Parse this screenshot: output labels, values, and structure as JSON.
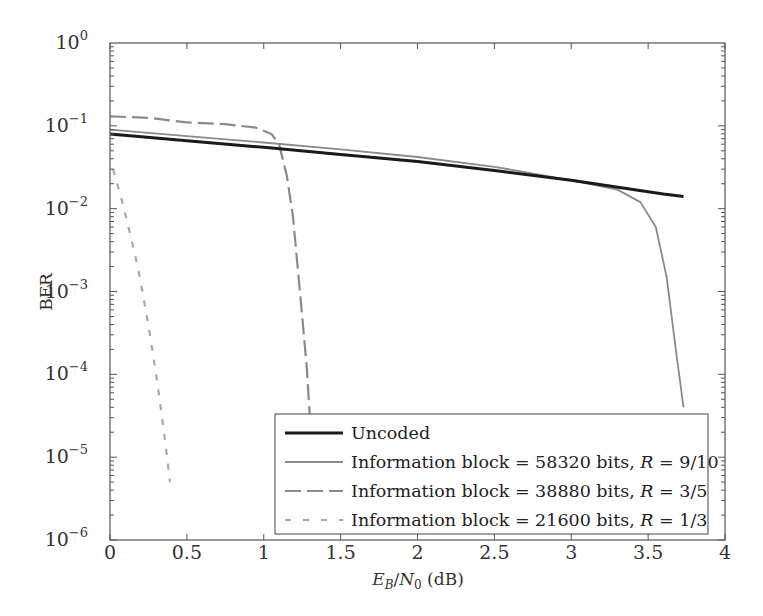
{
  "chart_data": {
    "type": "line",
    "title": "",
    "xlabel": "E_B/N_0 (dB)",
    "xlabel_parts": {
      "E": "E",
      "Esub": "B",
      "slash": "/",
      "N": "N",
      "Nsub": "0",
      "unit": " (dB)"
    },
    "ylabel": "BER",
    "xlim": [
      0,
      4
    ],
    "ylim": [
      1e-06,
      1
    ],
    "yscale": "log",
    "grid": false,
    "legend_position": "lower right",
    "x_ticks": [
      "0",
      "0.5",
      "1",
      "1.5",
      "2",
      "2.5",
      "3",
      "3.5",
      "4"
    ],
    "x_tick_values": [
      0,
      0.5,
      1,
      1.5,
      2,
      2.5,
      3,
      3.5,
      4
    ],
    "y_ticks": [
      {
        "base": "10",
        "exp": "0",
        "value": 1
      },
      {
        "base": "10",
        "exp": "−1",
        "value": 0.1
      },
      {
        "base": "10",
        "exp": "−2",
        "value": 0.01
      },
      {
        "base": "10",
        "exp": "−3",
        "value": 0.001
      },
      {
        "base": "10",
        "exp": "−4",
        "value": 0.0001
      },
      {
        "base": "10",
        "exp": "−5",
        "value": 1e-05
      },
      {
        "base": "10",
        "exp": "−6",
        "value": 1e-06
      }
    ],
    "series": [
      {
        "name": "Uncoded",
        "label_plain": "Uncoded",
        "style": "solid-thick",
        "color": "#1a1a1a",
        "x": [
          0,
          0.5,
          1,
          1.5,
          2,
          2.5,
          3,
          3.5,
          3.6,
          3.73
        ],
        "y": [
          0.08,
          0.066,
          0.055,
          0.045,
          0.037,
          0.029,
          0.022,
          0.016,
          0.015,
          0.014
        ]
      },
      {
        "name": "Information block = 58320 bits, R = 9/10",
        "label_plain": "Information block = 58320 bits, ",
        "label_rate": "9/10",
        "style": "solid-thin",
        "color": "#8a8a8a",
        "x": [
          0,
          0.5,
          1,
          1.5,
          2,
          2.5,
          3,
          3.3,
          3.45,
          3.55,
          3.62,
          3.68,
          3.73
        ],
        "y": [
          0.09,
          0.075,
          0.063,
          0.052,
          0.042,
          0.032,
          0.022,
          0.017,
          0.012,
          0.006,
          0.0015,
          0.0002,
          4e-05
        ]
      },
      {
        "name": "Information block = 38880 bits, R = 3/5",
        "label_plain": "Information block = 38880 bits, ",
        "label_rate": "3/5",
        "style": "long-dash",
        "color": "#8a8a8a",
        "x": [
          0,
          0.25,
          0.5,
          0.75,
          0.95,
          1.05,
          1.1,
          1.15,
          1.19,
          1.22,
          1.25,
          1.28,
          1.3
        ],
        "y": [
          0.13,
          0.125,
          0.11,
          0.105,
          0.095,
          0.08,
          0.06,
          0.025,
          0.008,
          0.002,
          0.0005,
          0.00012,
          3e-05
        ]
      },
      {
        "name": "Information block = 21600 bits, R = 1/3",
        "label_plain": "Information block = 21600 bits, ",
        "label_rate": "1/3",
        "style": "short-dash",
        "color": "#a8a8a8",
        "x": [
          0.02,
          0.08,
          0.13,
          0.18,
          0.22,
          0.26,
          0.3,
          0.33,
          0.36,
          0.39
        ],
        "y": [
          0.03,
          0.012,
          0.005,
          0.002,
          0.0008,
          0.0003,
          0.0001,
          4e-05,
          1.5e-05,
          5e-06
        ]
      }
    ]
  }
}
